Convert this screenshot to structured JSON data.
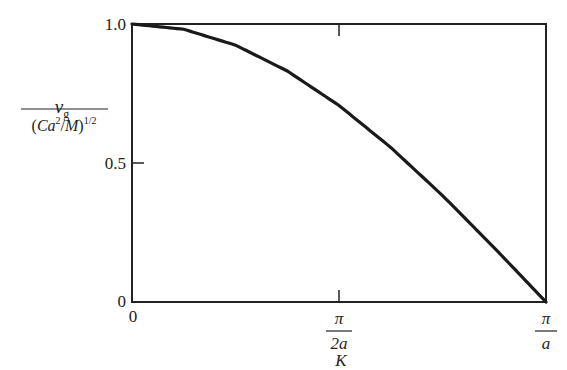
{
  "chart_data": {
    "type": "line",
    "title": "",
    "xlabel": "K",
    "ylabel": "v_g / (Ca^2/M)^(1/2)",
    "ylabel_parts": {
      "numerator": "v",
      "numerator_sub": "g",
      "denominator_open": "(Ca",
      "denominator_sup": "2",
      "denominator_mid": "/M)",
      "denominator_exp": "1/2"
    },
    "xlim": [
      0,
      3.14159
    ],
    "ylim": [
      0,
      1.0
    ],
    "x_ticks": [
      {
        "value": 0,
        "label": "0"
      },
      {
        "value": 1.5708,
        "label": "π/2a",
        "numerator": "π",
        "denominator": "2a"
      },
      {
        "value": 3.14159,
        "label": "π/a",
        "numerator": "π",
        "denominator": "a"
      }
    ],
    "y_ticks": [
      {
        "value": 0,
        "label": "0"
      },
      {
        "value": 0.5,
        "label": "0.5"
      },
      {
        "value": 1.0,
        "label": "1.0"
      }
    ],
    "grid": false,
    "legend": null,
    "series": [
      {
        "name": "v_g normalized = cos(Ka/2)",
        "x": [
          0,
          0.3927,
          0.7854,
          1.1781,
          1.5708,
          1.9635,
          2.3562,
          2.7489,
          3.14159
        ],
        "y": [
          1.0,
          0.981,
          0.924,
          0.831,
          0.707,
          0.556,
          0.383,
          0.195,
          0.0
        ]
      }
    ]
  }
}
